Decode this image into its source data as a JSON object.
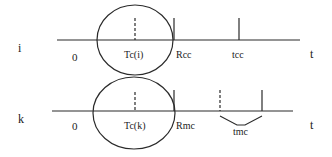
{
  "diagram": {
    "colors": {
      "stroke": "#2a2a2a",
      "background": "#ffffff",
      "text": "#222222"
    },
    "timelines": [
      {
        "id": "i",
        "row_label": "i",
        "origin_label": "0",
        "center_label": "Tc(i)",
        "boundary_label": "Rcc",
        "marker_label": "tcc",
        "axis_label": "t"
      },
      {
        "id": "k",
        "row_label": "k",
        "origin_label": "0",
        "center_label": "Tc(k)",
        "boundary_label": "Rmc",
        "interval_label": "tmc",
        "axis_label": "t"
      }
    ]
  }
}
